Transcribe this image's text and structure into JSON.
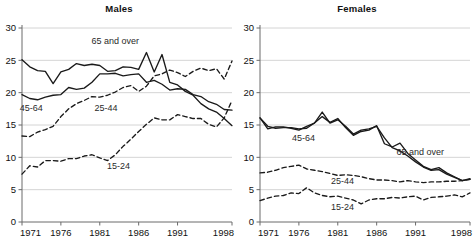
{
  "figure": {
    "panels": [
      {
        "id": "males",
        "title": "Males"
      },
      {
        "id": "females",
        "title": "Females"
      }
    ]
  },
  "chart_data": [
    {
      "type": "line",
      "title": "Males",
      "xlabel": "",
      "ylabel": "",
      "xlim": [
        1971,
        1998
      ],
      "ylim": [
        0,
        30
      ],
      "yticks": [
        0,
        5,
        10,
        15,
        20,
        25,
        30
      ],
      "xticks": [
        1971,
        1976,
        1981,
        1986,
        1991,
        1998
      ],
      "grid": "horizontal",
      "legend": "inline-annotations",
      "x": [
        1971,
        1972,
        1973,
        1974,
        1975,
        1976,
        1977,
        1978,
        1979,
        1980,
        1981,
        1982,
        1983,
        1984,
        1985,
        1986,
        1987,
        1988,
        1989,
        1990,
        1991,
        1992,
        1993,
        1994,
        1995,
        1996,
        1997,
        1998
      ],
      "series": [
        {
          "name": "65 and over",
          "style": "solid",
          "color": "#1a1a1a",
          "values": [
            25.1,
            24.0,
            23.4,
            23.3,
            21.4,
            23.2,
            23.6,
            24.5,
            24.2,
            24.4,
            24.2,
            23.3,
            23.4,
            24.0,
            23.9,
            23.6,
            26.2,
            23.2,
            25.9,
            21.6,
            21.2,
            20.2,
            19.6,
            18.3,
            17.5,
            17.0,
            16.0,
            14.9
          ]
        },
        {
          "name": "45-64",
          "style": "solid",
          "color": "#1a1a1a",
          "values": [
            19.7,
            19.1,
            18.9,
            19.3,
            19.6,
            19.7,
            20.8,
            20.5,
            20.7,
            21.6,
            22.9,
            22.9,
            23.0,
            22.6,
            22.8,
            22.9,
            21.6,
            21.9,
            21.3,
            20.4,
            20.6,
            20.5,
            19.7,
            19.4,
            18.6,
            18.2,
            17.4,
            17.3
          ]
        },
        {
          "name": "25-44",
          "style": "dashed",
          "color": "#1a1a1a",
          "values": [
            13.3,
            13.2,
            13.9,
            14.3,
            14.8,
            16.3,
            17.5,
            18.3,
            18.8,
            19.4,
            19.3,
            19.6,
            20.1,
            20.8,
            21.1,
            20.2,
            21.0,
            22.6,
            22.9,
            23.5,
            23.1,
            22.5,
            23.3,
            23.8,
            23.4,
            23.7,
            22.1,
            24.9
          ]
        },
        {
          "name": "15-24",
          "style": "dashed",
          "color": "#1a1a1a",
          "values": [
            7.4,
            8.7,
            8.5,
            9.5,
            9.5,
            9.4,
            9.8,
            9.8,
            10.2,
            10.4,
            9.9,
            9.5,
            10.4,
            11.7,
            12.8,
            14.0,
            15.1,
            16.1,
            15.8,
            15.8,
            16.6,
            16.3,
            16.0,
            16.0,
            15.1,
            14.7,
            16.1,
            18.8
          ]
        }
      ]
    },
    {
      "type": "line",
      "title": "Females",
      "xlabel": "",
      "ylabel": "",
      "xlim": [
        1971,
        1998
      ],
      "ylim": [
        0,
        30
      ],
      "yticks": [
        0,
        5,
        10,
        15,
        20,
        25,
        30
      ],
      "xticks": [
        1971,
        1976,
        1981,
        1986,
        1991,
        1998
      ],
      "grid": "horizontal",
      "legend": "inline-annotations",
      "x": [
        1971,
        1972,
        1973,
        1974,
        1975,
        1976,
        1977,
        1978,
        1979,
        1980,
        1981,
        1982,
        1983,
        1984,
        1985,
        1986,
        1987,
        1988,
        1989,
        1990,
        1991,
        1992,
        1993,
        1994,
        1995,
        1996,
        1997,
        1998
      ],
      "series": [
        {
          "name": "65 and over",
          "style": "solid",
          "color": "#1a1a1a",
          "values": [
            16.1,
            14.4,
            14.7,
            14.7,
            14.5,
            14.2,
            14.8,
            15.3,
            16.3,
            15.4,
            16.0,
            14.6,
            13.4,
            14.0,
            14.2,
            14.9,
            12.1,
            11.6,
            12.2,
            10.6,
            9.6,
            8.6,
            8.1,
            8.4,
            7.6,
            7.0,
            6.4,
            6.7
          ]
        },
        {
          "name": "45-64",
          "style": "solid",
          "color": "#1a1a1a",
          "values": [
            16.1,
            14.8,
            14.5,
            14.6,
            14.6,
            14.4,
            14.5,
            15.3,
            17.0,
            15.3,
            15.8,
            14.8,
            13.6,
            14.2,
            14.4,
            14.8,
            13.0,
            11.5,
            11.0,
            10.2,
            9.3,
            8.5,
            8.0,
            8.1,
            7.4,
            6.9,
            6.4,
            6.6
          ]
        },
        {
          "name": "25-44",
          "style": "dashed",
          "color": "#1a1a1a",
          "values": [
            7.6,
            7.7,
            8.0,
            8.4,
            8.6,
            8.8,
            8.2,
            8.0,
            7.8,
            7.5,
            7.2,
            7.3,
            7.2,
            7.0,
            6.7,
            6.5,
            6.5,
            6.4,
            6.2,
            6.4,
            6.2,
            6.1,
            6.2,
            6.2,
            6.3,
            6.3,
            6.4,
            6.6
          ]
        },
        {
          "name": "15-24",
          "style": "dashed",
          "color": "#1a1a1a",
          "values": [
            3.3,
            3.7,
            4.0,
            4.1,
            4.5,
            4.4,
            5.3,
            4.5,
            4.1,
            3.9,
            4.0,
            3.7,
            3.4,
            2.8,
            3.4,
            3.6,
            3.6,
            3.8,
            3.7,
            3.9,
            4.0,
            3.4,
            3.8,
            3.9,
            4.0,
            4.2,
            3.9,
            4.5
          ]
        }
      ]
    }
  ],
  "annotations": {
    "males": [
      {
        "text": "65 and over",
        "x": 1983.0,
        "y": 27.6
      },
      {
        "text": "45-64",
        "x": 1972.2,
        "y": 17.2
      },
      {
        "text": "25-44",
        "x": 1981.8,
        "y": 17.2
      },
      {
        "text": "15-24",
        "x": 1983.4,
        "y": 8.2
      }
    ],
    "females": [
      {
        "text": "45-64",
        "x": 1976.6,
        "y": 12.6
      },
      {
        "text": "65 and over",
        "x": 1991.6,
        "y": 10.3
      },
      {
        "text": "25-44",
        "x": 1981.6,
        "y": 5.9
      },
      {
        "text": "15-24",
        "x": 1981.6,
        "y": 1.9
      }
    ]
  },
  "axis": {
    "ytick_labels": [
      "0",
      "5",
      "10",
      "15",
      "20",
      "25",
      "30"
    ],
    "xtick_labels": [
      "1971",
      "1976",
      "1981",
      "1986",
      "1991",
      "1998"
    ]
  },
  "colors": {
    "line": "#1a1a1a",
    "grid": "#c9c9c9",
    "axis": "#6b6b6b",
    "text": "#111111",
    "background": "#ffffff"
  }
}
